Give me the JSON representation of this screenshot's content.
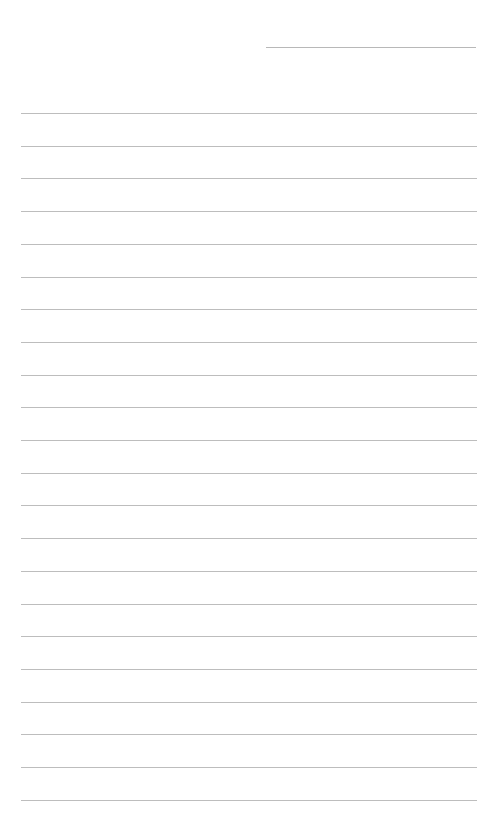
{
  "page": {
    "type": "lined-notepaper",
    "header_line": {
      "left": 266,
      "top": 47,
      "width": 210
    },
    "ruled_lines": {
      "count": 22,
      "first_top": 113,
      "spacing": 32.7,
      "left": 21,
      "width": 456,
      "color": "#bdbdbd"
    },
    "background_color": "#ffffff"
  }
}
